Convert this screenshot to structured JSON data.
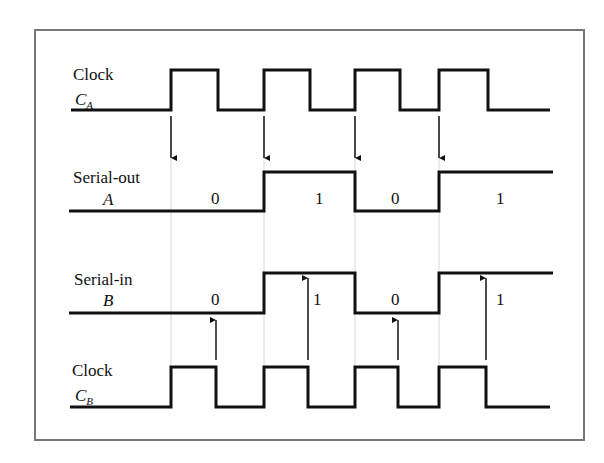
{
  "colors": {
    "wave": "#111111",
    "frame": "#777777",
    "guide": "#d8d8d8",
    "background": "#ffffff"
  },
  "signals": [
    {
      "id": "clock-a",
      "label": "Clock",
      "symbol": "C",
      "subscript": "A"
    },
    {
      "id": "serial-out",
      "label": "Serial-out",
      "symbol": "A"
    },
    {
      "id": "serial-in",
      "label": "Serial-in",
      "symbol": "B"
    },
    {
      "id": "clock-b",
      "label": "Clock",
      "symbol": "C",
      "subscript": "B"
    }
  ],
  "bit_values": {
    "serial_out": [
      "0",
      "1",
      "0",
      "1"
    ],
    "serial_in": [
      "0",
      "1",
      "0",
      "1"
    ]
  },
  "arrows": {
    "clock_a": "down-arrow",
    "clock_b": "up-arrow"
  }
}
